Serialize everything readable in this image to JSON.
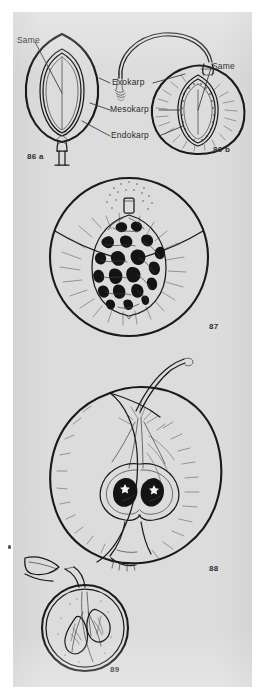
{
  "plate": {
    "background_color": "#dcdcdc",
    "page_color": "#ffffff",
    "ink_color": "#1a1a1a"
  },
  "labels": {
    "same_left": "Same",
    "same_right": "Same",
    "exokarp": "Exokarp",
    "mesokarp": "Mesokarp",
    "endokarp": "Endokarp"
  },
  "figures": [
    {
      "id": "86a",
      "number": "86 a",
      "caption_x": 14,
      "caption_y": 141
    },
    {
      "id": "86b",
      "number": "86 b",
      "caption_x": 200,
      "caption_y": 134
    },
    {
      "id": "87",
      "number": "87",
      "caption_x": 196,
      "caption_y": 311
    },
    {
      "id": "88",
      "number": "88",
      "caption_x": 196,
      "caption_y": 553
    },
    {
      "id": "89",
      "number": "89",
      "caption_x": 97,
      "caption_y": 654
    }
  ]
}
